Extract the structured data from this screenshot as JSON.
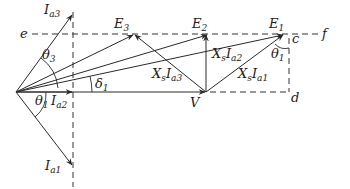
{
  "diagram": {
    "type": "phasor-diagram",
    "colors": {
      "line": "#2a2a2a",
      "background": "#ffffff",
      "text": "#222222"
    },
    "points": {
      "origin": {
        "x": 16,
        "y": 92
      },
      "V": {
        "x": 206,
        "y": 92,
        "label": "V"
      },
      "E1": {
        "x": 284,
        "y": 34,
        "label": "E",
        "sub": "1"
      },
      "E2": {
        "x": 208,
        "y": 34,
        "label": "E",
        "sub": "2"
      },
      "E3": {
        "x": 134,
        "y": 34,
        "label": "E",
        "sub": "3"
      },
      "c": {
        "x": 289,
        "y": 34,
        "label": "c"
      },
      "d": {
        "x": 289,
        "y": 92,
        "label": "d"
      },
      "e": {
        "x": 22,
        "y": 34,
        "label": "e"
      },
      "f": {
        "x": 326,
        "y": 34,
        "label": "f"
      },
      "Ia1_tip": {
        "x": 72,
        "y": 165,
        "label": "I",
        "sub": "a1"
      },
      "Ia2_tip": {
        "x": 72,
        "y": 92,
        "label": "I",
        "sub": "a2"
      },
      "Ia3_tip": {
        "x": 72,
        "y": 15,
        "label": "I",
        "sub": "a3"
      }
    },
    "labels": {
      "Ia3": {
        "main": "I",
        "sub": "a3"
      },
      "Ia2": {
        "main": "I",
        "sub": "a2"
      },
      "Ia1": {
        "main": "I",
        "sub": "a1"
      },
      "E1": {
        "main": "E",
        "sub": "1"
      },
      "E2": {
        "main": "E",
        "sub": "2"
      },
      "E3": {
        "main": "E",
        "sub": "3"
      },
      "V": {
        "main": "V"
      },
      "c": {
        "main": "c"
      },
      "d": {
        "main": "d"
      },
      "e": {
        "main": "e"
      },
      "f": {
        "main": "f"
      },
      "theta3": {
        "main": "θ",
        "sub": "3"
      },
      "theta1_left": {
        "main": "θ",
        "sub": "1"
      },
      "theta1_right": {
        "main": "θ",
        "sub": "1"
      },
      "delta1": {
        "main": "δ",
        "sub": "1"
      },
      "XsIa1": {
        "main": "X",
        "s": "s",
        "I": "I",
        "sub": "a1"
      },
      "XsIa2": {
        "main": "X",
        "s": "s",
        "I": "I",
        "sub": "a2"
      },
      "XsIa3": {
        "main": "X",
        "s": "s",
        "I": "I",
        "sub": "a3"
      }
    },
    "phasors": [
      {
        "name": "V",
        "from": "origin",
        "to": "V"
      },
      {
        "name": "E1",
        "from": "origin",
        "to": "E1"
      },
      {
        "name": "E2",
        "from": "origin",
        "to": "E2"
      },
      {
        "name": "E3",
        "from": "origin",
        "to": "E3"
      },
      {
        "name": "XsIa1",
        "from": "V",
        "to": "E1"
      },
      {
        "name": "XsIa2",
        "from": "V",
        "to": "E2"
      },
      {
        "name": "XsIa3",
        "from": "V",
        "to": "E3"
      },
      {
        "name": "Ia1",
        "from": "origin",
        "to": "Ia1_tip"
      },
      {
        "name": "Ia2",
        "from": "origin",
        "to": "Ia2_tip"
      },
      {
        "name": "Ia3",
        "from": "origin",
        "to": "Ia3_tip"
      }
    ],
    "dashed_lines": [
      {
        "name": "e-f",
        "from": "e",
        "to": "f"
      },
      {
        "name": "current-locus",
        "x": 73,
        "y1": 12,
        "y2": 187
      },
      {
        "name": "c-d",
        "from": "c",
        "to": "d"
      },
      {
        "name": "V-d",
        "from": "V",
        "to": "d"
      }
    ]
  }
}
